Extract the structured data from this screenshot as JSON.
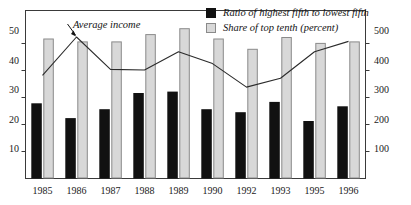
{
  "chart_data": {
    "type": "bar",
    "title": "",
    "subtitle": "",
    "xlabel": "",
    "ylabel": "",
    "categories": [
      "1985",
      "1986",
      "1987",
      "1988",
      "1989",
      "1990",
      "1992",
      "1993",
      "1995",
      "1996"
    ],
    "grid": false,
    "legend_position": "top-right",
    "left_axis": {
      "ticks": [
        10,
        20,
        30,
        40,
        50
      ],
      "tick_labels": [
        "10",
        "20",
        "30",
        "40",
        "50"
      ],
      "ylim": [
        0,
        57
      ]
    },
    "right_axis": {
      "ticks": [
        100,
        200,
        300,
        400,
        500
      ],
      "tick_labels": [
        "100",
        "200",
        "300",
        "400",
        "500"
      ],
      "ylim": [
        0,
        570
      ]
    },
    "series": [
      {
        "name": "Ratio of highest fifth to lowest fifth",
        "type": "bar",
        "axis": "left",
        "color": "#111111",
        "values": [
          25.5,
          20.5,
          23.5,
          29.0,
          29.5,
          23.5,
          22.5,
          26.0,
          19.5,
          24.5
        ]
      },
      {
        "name": "Share of top tenth (percent)",
        "type": "bar",
        "axis": "left",
        "color": "#d8d8d8",
        "values": [
          47.5,
          46.5,
          46.5,
          49.0,
          51.0,
          47.5,
          44.0,
          48.0,
          46.0,
          46.5
        ]
      },
      {
        "name": "Average income",
        "type": "line",
        "axis": "right",
        "color": "#2b2b2b",
        "values": [
          350,
          480,
          370,
          368,
          430,
          390,
          310,
          340,
          430,
          465
        ]
      }
    ],
    "annotations": [
      {
        "text": "Average income",
        "points_to_category": "1986"
      }
    ]
  },
  "legend": {
    "items": [
      {
        "label": "Ratio of highest fifth to lowest fifth",
        "swatch": "dark"
      },
      {
        "label": "Share of top tenth (percent)",
        "swatch": "light"
      }
    ]
  }
}
